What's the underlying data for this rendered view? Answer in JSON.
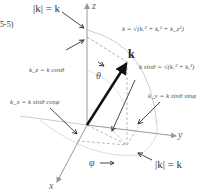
{
  "equation_number": "5-5)",
  "labels": {
    "mag_top": "|k| = k",
    "mag_bottom": "|k| = k",
    "k_total": "k = √(kₓ² + kᵧ² + k_z²)",
    "k_vector": "k",
    "k_sin_theta": "k sinθ = √(kₓ² + kᵧ²)",
    "k_z": "k_z = k cosθ",
    "k_y": "k_y = k sinθ sinφ",
    "k_x": "k_x = k sinθ cosφ",
    "theta": "θ",
    "phi": "φ"
  },
  "axes": {
    "z": "z",
    "y": "y",
    "x": "x"
  },
  "colors": {
    "axis": "#888888",
    "vector": "#111111",
    "arrow": "#333333",
    "dashed": "#999999",
    "sphere": "#cccccc"
  }
}
